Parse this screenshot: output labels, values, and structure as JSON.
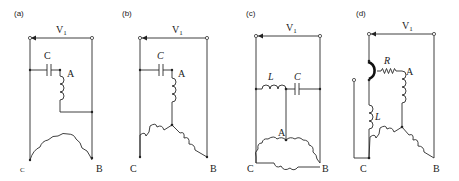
{
  "figure": {
    "panels": [
      {
        "id": "a",
        "label": "(a)",
        "voltage": "V",
        "voltage_sub": "1",
        "cap": "C",
        "node_a": "A",
        "node_c": "C",
        "node_b": "B",
        "configuration": "single-phase motor, capacitor-start, delta-like winding"
      },
      {
        "id": "b",
        "label": "(b)",
        "voltage": "V",
        "voltage_sub": "1",
        "cap": "C",
        "node_a": "A",
        "node_c": "C",
        "node_b": "B",
        "configuration": "star with capacitor"
      },
      {
        "id": "c",
        "label": "(c)",
        "voltage": "V",
        "voltage_sub": "1",
        "ind": "L",
        "cap": "C",
        "node_a": "A",
        "node_c": "C",
        "node_b": "B",
        "configuration": "delta with L-C"
      },
      {
        "id": "d",
        "label": "(d)",
        "voltage": "V",
        "voltage_sub": "1",
        "res": "R",
        "ind": "L",
        "node_a": "A",
        "node_c": "C",
        "node_b": "B",
        "configuration": "star with R and L, switch"
      }
    ]
  }
}
